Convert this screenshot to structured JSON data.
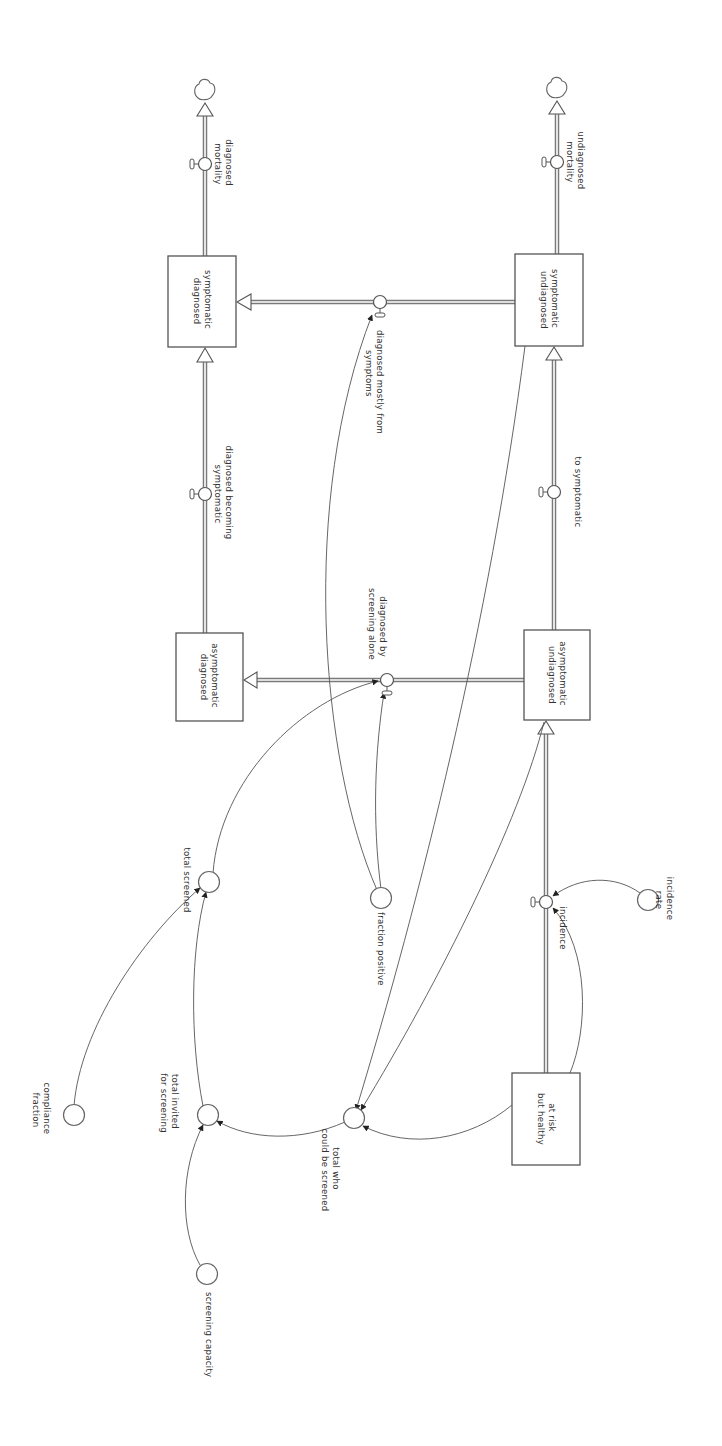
{
  "diagram": {
    "type": "stock-and-flow",
    "orientation": "rotated 90deg clockwise",
    "colors": {
      "line": "#555555",
      "background": "#ffffff",
      "text": "#333333"
    },
    "stocks": [
      {
        "id": "at_risk",
        "label_lines": [
          "at risk",
          "but healthy"
        ],
        "x": 512,
        "y": 1073,
        "w": 68,
        "h": 92
      },
      {
        "id": "asym_undiag",
        "label_lines": [
          "asymptomatic",
          "undiagnosed"
        ],
        "x": 524,
        "y": 630,
        "w": 66,
        "h": 90
      },
      {
        "id": "sym_undiag",
        "label_lines": [
          "symptomatic",
          "undiagnosed"
        ],
        "x": 515,
        "y": 254,
        "w": 68,
        "h": 92
      },
      {
        "id": "asym_diag",
        "label_lines": [
          "asymptomatic",
          "diagnosed"
        ],
        "x": 176,
        "y": 633,
        "w": 67,
        "h": 88
      },
      {
        "id": "sym_diag",
        "label_lines": [
          "symptomatic",
          "diagnosed"
        ],
        "x": 168,
        "y": 256,
        "w": 68,
        "h": 91
      }
    ],
    "flows": [
      {
        "id": "incidence",
        "label_lines": [
          "incidence"
        ],
        "valve": [
          546,
          902
        ]
      },
      {
        "id": "to_symptomatic",
        "label_lines": [
          "to symptomatic"
        ],
        "valve": [
          554,
          492
        ]
      },
      {
        "id": "undiagnosed_mortality",
        "label_lines": [
          "undiagnosed",
          "mortality"
        ],
        "valve": [
          557,
          162
        ]
      },
      {
        "id": "diagnosed_by_screening_alone",
        "label_lines": [
          "diagnosed by",
          "screening alone"
        ],
        "valve": [
          387,
          680
        ]
      },
      {
        "id": "diagnosed_mostly_from_symptoms",
        "label_lines": [
          "diagnosed mostly from",
          "symptoms"
        ],
        "valve": [
          380,
          302
        ]
      },
      {
        "id": "diagnosed_becoming_symptomatic",
        "label_lines": [
          "diagnosed becoming",
          "symptomatic"
        ],
        "valve": [
          205,
          494
        ]
      },
      {
        "id": "diagnosed_mortality",
        "label_lines": [
          "diagnosed",
          "mortality"
        ],
        "valve": [
          205,
          164
        ]
      }
    ],
    "converters": [
      {
        "id": "incidence_rate",
        "label_lines": [
          "incidence",
          "rate"
        ],
        "cx": 648,
        "cy": 900
      },
      {
        "id": "fraction_positive",
        "label_lines": [
          "fraction positive"
        ],
        "cx": 381,
        "cy": 898
      },
      {
        "id": "total_screened",
        "label_lines": [
          "total screened"
        ],
        "cx": 209,
        "cy": 882
      },
      {
        "id": "total_invited",
        "label_lines": [
          "total invited",
          "for screening"
        ],
        "cx": 208,
        "cy": 1115
      },
      {
        "id": "total_who_could_be_screened",
        "label_lines": [
          "total who",
          "could be screened"
        ],
        "cx": 354,
        "cy": 1118
      },
      {
        "id": "compliance_fraction",
        "label_lines": [
          "compliance",
          "fraction"
        ],
        "cx": 74,
        "cy": 1115
      },
      {
        "id": "screening_capacity",
        "label_lines": [
          "screening capacity"
        ],
        "cx": 207,
        "cy": 1274
      }
    ],
    "sinks": [
      {
        "id": "sink_undiag",
        "cx": 557,
        "cy": 88
      },
      {
        "id": "sink_diag",
        "cx": 205,
        "cy": 90
      }
    ]
  }
}
